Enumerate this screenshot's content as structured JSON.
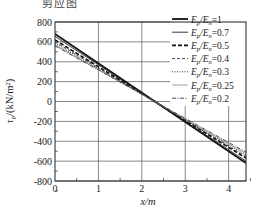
{
  "caption": "剪应图",
  "chart_data": {
    "type": "line",
    "title": "",
    "xlabel": "x/m",
    "ylabel": "τp/(kN/m²)",
    "xlim": [
      0,
      4.4
    ],
    "ylim": [
      -800,
      800
    ],
    "xticks": [
      0,
      1,
      2,
      3,
      4
    ],
    "yticks": [
      800,
      600,
      400,
      200,
      0,
      -200,
      -400,
      -600,
      -800
    ],
    "grid": true,
    "legend_position": "upper right",
    "x": [
      0,
      4.4
    ],
    "series": [
      {
        "name": "Ep/En=1",
        "label_main": "E",
        "sub1": "p",
        "sub2": "n",
        "ratio": "1",
        "values": [
          680,
          -620
        ],
        "style": "solid-thick"
      },
      {
        "name": "Ep/En=0.7",
        "label_main": "E",
        "sub1": "p",
        "sub2": "n",
        "ratio": "0.7",
        "values": [
          655,
          -600
        ],
        "style": "solid-thin"
      },
      {
        "name": "Ep/En=0.5",
        "label_main": "E",
        "sub1": "p",
        "sub2": "n",
        "ratio": "0.5",
        "values": [
          620,
          -570
        ],
        "style": "dashed-thick"
      },
      {
        "name": "Ep/En=0.4",
        "label_main": "E",
        "sub1": "p",
        "sub2": "n",
        "ratio": "0.4",
        "values": [
          600,
          -555
        ],
        "style": "dashed-thin"
      },
      {
        "name": "Ep/En=0.3",
        "label_main": "E",
        "sub1": "p",
        "sub2": "n",
        "ratio": "0.3",
        "values": [
          585,
          -540
        ],
        "style": "dotted"
      },
      {
        "name": "Ep/En=0.25",
        "label_main": "E",
        "sub1": "p",
        "sub2": "n",
        "ratio": "0.25",
        "values": [
          570,
          -525
        ],
        "style": "solid-light"
      },
      {
        "name": "Ep/En=0.2",
        "label_main": "E",
        "sub1": "p",
        "sub2": "n",
        "ratio": "0.2",
        "values": [
          560,
          -510
        ],
        "style": "dashdot"
      }
    ]
  }
}
